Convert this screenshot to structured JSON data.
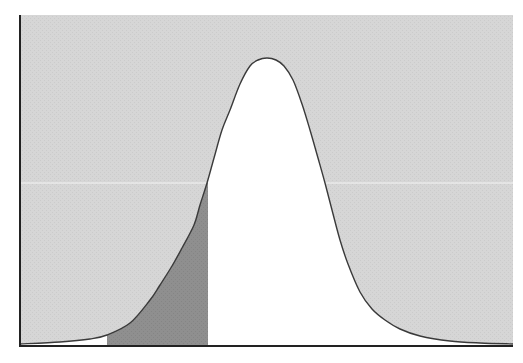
{
  "figure": {
    "title": "",
    "description": "Bell-shaped density curve; region outside curve shaded light gray, tail region from left cutoff to critical value shaded dark gray",
    "background_shade": "#d4d4d4",
    "tail_shade": "#8e8e8e",
    "curve_color": "#3a3a3a",
    "axis_color": "#222222",
    "reference_line_color": "#f2f2f2"
  },
  "chart_data": {
    "type": "area",
    "title": "",
    "xlabel": "",
    "ylabel": "",
    "grid": false,
    "legend": null,
    "pixel_frame": {
      "left": 20,
      "right": 513,
      "top": 15,
      "baseline": 346
    },
    "curve_points_px": [
      [
        20,
        344
      ],
      [
        60,
        342
      ],
      [
        90,
        339
      ],
      [
        107,
        335
      ],
      [
        130,
        323
      ],
      [
        150,
        300
      ],
      [
        160,
        285
      ],
      [
        172,
        266
      ],
      [
        182,
        248
      ],
      [
        194,
        225
      ],
      [
        200,
        205
      ],
      [
        207,
        183
      ],
      [
        214,
        158
      ],
      [
        222,
        130
      ],
      [
        230,
        110
      ],
      [
        240,
        84
      ],
      [
        250,
        66
      ],
      [
        258,
        60
      ],
      [
        267,
        58
      ],
      [
        276,
        60
      ],
      [
        284,
        66
      ],
      [
        293,
        80
      ],
      [
        302,
        104
      ],
      [
        310,
        130
      ],
      [
        318,
        158
      ],
      [
        325,
        183
      ],
      [
        332,
        210
      ],
      [
        340,
        240
      ],
      [
        348,
        264
      ],
      [
        360,
        292
      ],
      [
        372,
        309
      ],
      [
        385,
        320
      ],
      [
        400,
        329
      ],
      [
        420,
        336
      ],
      [
        450,
        341
      ],
      [
        480,
        343
      ],
      [
        513,
        344
      ]
    ],
    "shaded_tail": {
      "x_start_px": 107,
      "x_end_px": 208,
      "color": "#8e8e8e"
    },
    "reference_line": {
      "y_px": 183,
      "color": "#f2f2f2"
    },
    "peak": {
      "x_px": 267,
      "y_px": 58
    }
  }
}
